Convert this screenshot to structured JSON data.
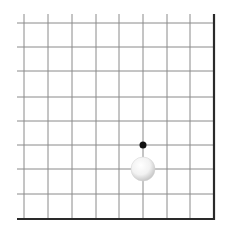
{
  "board": {
    "description": "Go board corner (bottom-right), 9x9 visible grid section",
    "grid_color": "#8a8a8a",
    "border_color": "#2a2a2a",
    "background": "#ffffff",
    "x_lines": [
      24,
      48,
      72,
      96,
      119,
      143,
      167,
      190
    ],
    "y_lines": [
      23,
      47,
      71,
      97,
      121,
      145,
      169,
      194
    ],
    "edge_x": 214,
    "edge_y": 219,
    "line_start_x": 17,
    "line_start_y": 14
  },
  "stones": [
    {
      "color": "white",
      "cx": 143,
      "cy": 169,
      "r": 12
    }
  ],
  "markers": [
    {
      "type": "black-dot",
      "cx": 143,
      "cy": 145,
      "r": 3.5,
      "color": "#111111"
    }
  ]
}
